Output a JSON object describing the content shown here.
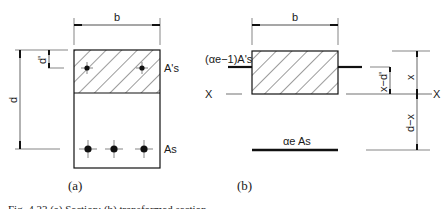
{
  "figure": {
    "panel_a": {
      "caption": "(a)",
      "width_label": "b",
      "depth_label": "d",
      "cover_label": "d'",
      "compression_steel_label": "A's",
      "tension_steel_label": "As"
    },
    "panel_b": {
      "caption": "(b)",
      "width_label": "b",
      "compression_steel_label": "(αe−1)A's",
      "tension_steel_label": "αe As",
      "neutral_axis_left": "X",
      "neutral_axis_right": "X",
      "dim_x": "x",
      "dim_x_minus_dprime": "x−d'",
      "dim_d_minus_x": "d−x"
    },
    "caption_clipped": "Fig. 4.23 (a) Section; (b) transformed section"
  }
}
